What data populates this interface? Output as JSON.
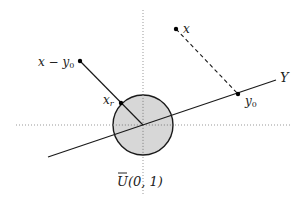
{
  "diagram": {
    "colors": {
      "stroke": "#1a1a1a",
      "disk_fill": "#d0d0d0",
      "axis": "#999999",
      "label": "#222222"
    },
    "axes": {
      "horizontal": {
        "y": 125,
        "x1": 16,
        "x2": 292
      },
      "vertical": {
        "x": 143,
        "y1": 10,
        "y2": 196
      }
    },
    "disk": {
      "cx": 143,
      "cy": 125,
      "r": 30,
      "label": "U(0, 1)",
      "label_bar": true
    },
    "line_Y": {
      "x1": 48,
      "y1": 157,
      "x2": 276,
      "y2": 80,
      "label": "Y"
    },
    "points": {
      "x": {
        "x": 176,
        "y": 29,
        "label": "x"
      },
      "y0": {
        "x": 238,
        "y": 94,
        "label": "y",
        "sub": "0"
      },
      "x_minus_y0": {
        "x": 80,
        "y": 61,
        "label": "x − y",
        "sub": "0"
      },
      "x_r": {
        "x": 121,
        "y": 104,
        "label": "x",
        "sub": "r"
      }
    },
    "segments": [
      {
        "from": "x",
        "to": "y0",
        "style": "dashed"
      },
      {
        "from": "x_minus_y0",
        "to": "center",
        "style": "solid"
      }
    ]
  }
}
